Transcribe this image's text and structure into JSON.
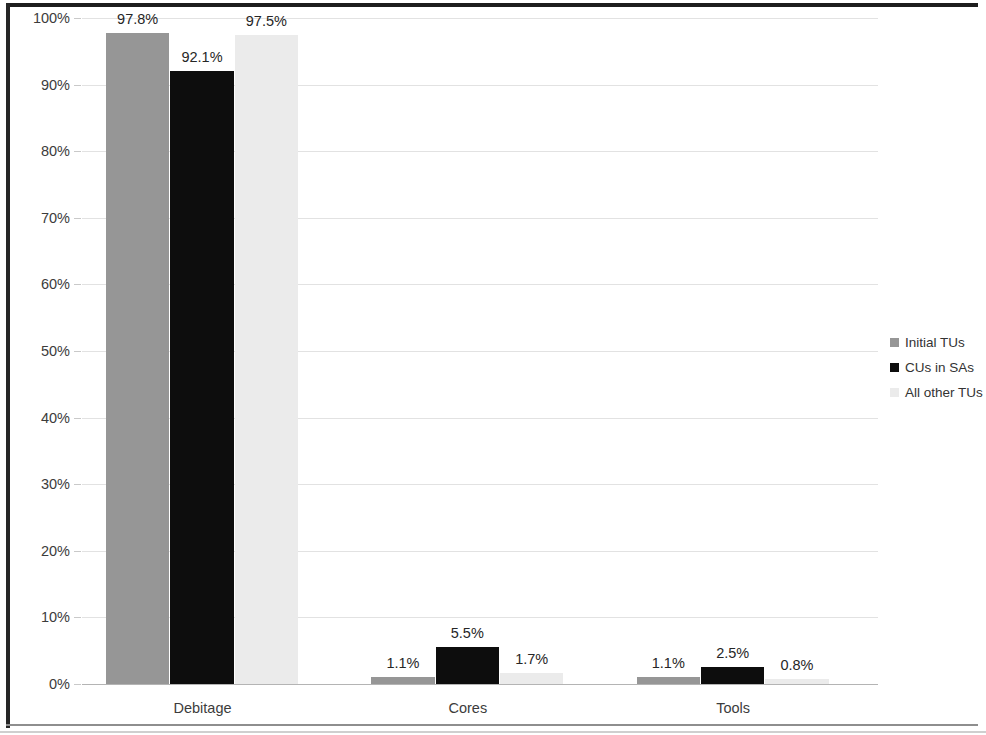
{
  "chart_data": {
    "type": "bar",
    "title": "",
    "xlabel": "",
    "ylabel": "",
    "categories": [
      "Debitage",
      "Cores",
      "Tools"
    ],
    "series": [
      {
        "name": "Initial TUs",
        "color": "#969696",
        "values": [
          97.8,
          1.1,
          1.1
        ],
        "labels": [
          "97.8%",
          "1.1%",
          "1.1%"
        ]
      },
      {
        "name": "CUs in SAs",
        "color": "#0d0d0d",
        "values": [
          92.1,
          5.5,
          2.5
        ],
        "labels": [
          "92.1%",
          "5.5%",
          "2.5%"
        ]
      },
      {
        "name": "All other TUs",
        "color": "#ebebeb",
        "values": [
          97.5,
          1.7,
          0.8
        ],
        "labels": [
          "97.5%",
          "1.7%",
          "0.8%"
        ]
      }
    ],
    "ylim": [
      0,
      100
    ],
    "y_ticks": [
      0,
      10,
      20,
      30,
      40,
      50,
      60,
      70,
      80,
      90,
      100
    ],
    "y_tick_labels": [
      "0%",
      "10%",
      "20%",
      "30%",
      "40%",
      "50%",
      "60%",
      "70%",
      "80%",
      "90%",
      "100%"
    ],
    "grid": true,
    "legend_position": "right",
    "value_labels_shown": true
  },
  "axis": {
    "y_tick_labels": [
      "100%",
      "90%",
      "80%",
      "70%",
      "60%",
      "50%",
      "40%",
      "30%",
      "20%",
      "10%",
      "0%"
    ],
    "category_labels": [
      "Debitage",
      "Cores",
      "Tools"
    ]
  },
  "legend": {
    "items": [
      {
        "label": "Initial TUs",
        "color": "#969696"
      },
      {
        "label": "CUs in SAs",
        "color": "#0d0d0d"
      },
      {
        "label": "All other TUs",
        "color": "#ebebeb"
      }
    ]
  },
  "colors": {
    "series_1": "#969696",
    "series_2": "#0d0d0d",
    "series_3": "#ebebeb",
    "gridline": "#e2e2e2",
    "axis": "#b4b4b4",
    "text": "#3c3c3c"
  }
}
